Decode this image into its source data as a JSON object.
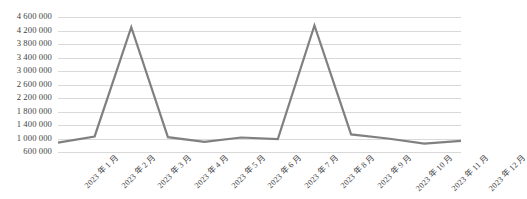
{
  "chart_data": {
    "type": "line",
    "title": "",
    "xlabel": "",
    "ylabel": "",
    "categories": [
      "2023 年 1 月",
      "2023 年 2 月",
      "2023 年 3 月",
      "2023 年 4 月",
      "2023 年 5 月",
      "2023 年 6 月",
      "2023 年 7 月",
      "2023 年 8 月",
      "2023 年 9 月",
      "2023 年 10 月",
      "2023 年 11 月",
      "2023 年 12 月"
    ],
    "values": [
      880000,
      1060000,
      4300000,
      1040000,
      900000,
      1030000,
      980000,
      4350000,
      1120000,
      1000000,
      850000,
      930000
    ],
    "ylim": [
      600000,
      4600000
    ],
    "ytick_values": [
      4600000,
      4200000,
      3800000,
      3400000,
      3000000,
      2600000,
      2200000,
      1800000,
      1400000,
      1000000,
      600000
    ],
    "ytick_labels": [
      "4 600 000",
      "4 200 000",
      "3 800 000",
      "3 400 000",
      "3 000 000",
      "2 600 000",
      "2 200 000",
      "1 800 000",
      "1 400 000",
      "1 000 000",
      "600 000"
    ],
    "grid": true,
    "legend": false,
    "legend_position": "none",
    "series_color": "#808080",
    "gridline_color": "#d9d9d9",
    "text_color": "#3f3f3f",
    "line_width": 2.2,
    "xtick_rotation": -45
  }
}
